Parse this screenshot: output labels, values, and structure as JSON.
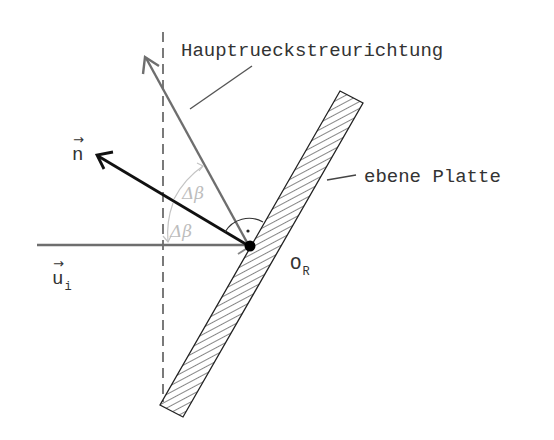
{
  "labels": {
    "main_backscatter": "Hauptrueckstreurichtung",
    "plate": "ebene Platte",
    "normal_vector": "n",
    "incident_vector": "u",
    "incident_vector_sub": "i",
    "origin": "O",
    "origin_sub": "R",
    "delta_beta_upper": "Δβ",
    "delta_beta_lower": "Δβ",
    "vector_arrow": "→"
  },
  "colors": {
    "line_dark": "#111111",
    "line_gray": "#6e6e6e",
    "angle_light": "#c4c4c4",
    "text": "#333333"
  }
}
